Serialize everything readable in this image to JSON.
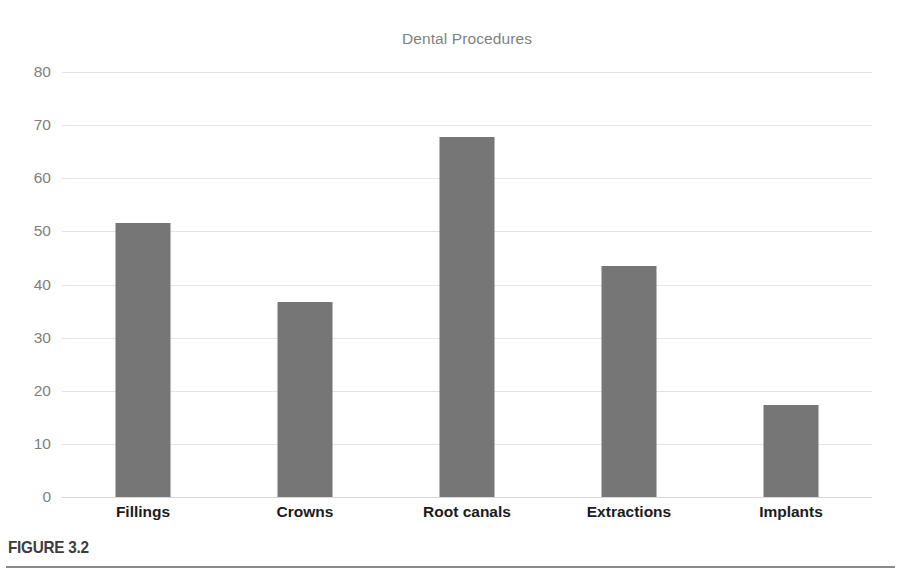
{
  "figure": {
    "caption_label": "FIGURE 3.2"
  },
  "chart_data": {
    "type": "bar",
    "title": "Dental Procedures",
    "xlabel": "",
    "ylabel": "",
    "categories": [
      "Fillings",
      "Crowns",
      "Root canals",
      "Extractions",
      "Implants"
    ],
    "values": [
      51.5,
      36.7,
      67.7,
      43.5,
      17.3
    ],
    "ylim": [
      0,
      80
    ],
    "ytick_step": 10,
    "yticks": [
      0,
      10,
      20,
      30,
      40,
      50,
      60,
      70,
      80
    ],
    "ytick_labels": [
      "0",
      "10",
      "20",
      "30",
      "40",
      "50",
      "60",
      "70",
      "80"
    ],
    "grid": "horizontal",
    "legend": "none",
    "bar_color": "#767676",
    "gridline_color": "#e4e4e4",
    "title_color": "#7f7f7f",
    "tick_label_color": "#808080",
    "category_label_color": "#1b1b1b",
    "background_color": "#ffffff"
  }
}
